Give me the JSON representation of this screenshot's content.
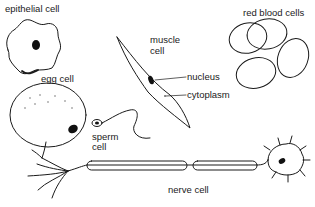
{
  "labels": {
    "epithelial": "epithelial cell",
    "egg": "egg cell",
    "muscle_line1": "muscle",
    "muscle_line2": "cell",
    "nucleus": "nucleus",
    "cytoplasm": "cytoplasm",
    "red_blood": "red blood cells",
    "sperm_line1": "sperm",
    "sperm_line2": "cell",
    "nerve": "nerve cell"
  },
  "colors": {
    "ink": "#1a1a1a",
    "background": "#ffffff"
  }
}
